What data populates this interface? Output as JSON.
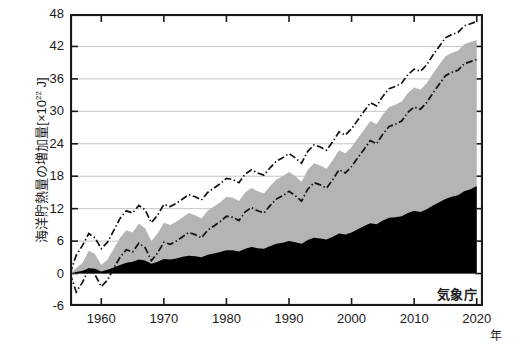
{
  "chart_data": {
    "type": "area",
    "title": "",
    "xlabel": "年",
    "ylabel_main": "海洋貯熱量の増加量[×10",
    "ylabel_sup": "22",
    "ylabel_tail": " J]",
    "credit": "気象庁",
    "xlim": [
      1955,
      2021
    ],
    "ylim": [
      -6,
      48
    ],
    "xticks": [
      1960,
      1970,
      1980,
      1990,
      2000,
      2010,
      2020
    ],
    "yticks": [
      -6,
      0,
      6,
      12,
      18,
      24,
      30,
      36,
      42,
      48
    ],
    "grid": "horizontal",
    "legend_position": "none",
    "colors": {
      "shallow_fill": "#000000",
      "deep_fill": "#b4b4b4",
      "bound_line": "#111111",
      "axis": "#1a1a1a",
      "grid": "#bdbdbd",
      "background": "#ffffff"
    },
    "x": [
      1955,
      1956,
      1957,
      1958,
      1959,
      1960,
      1961,
      1962,
      1963,
      1964,
      1965,
      1966,
      1967,
      1968,
      1969,
      1970,
      1971,
      1972,
      1973,
      1974,
      1975,
      1976,
      1977,
      1978,
      1979,
      1980,
      1981,
      1982,
      1983,
      1984,
      1985,
      1986,
      1987,
      1988,
      1989,
      1990,
      1991,
      1992,
      1993,
      1994,
      1995,
      1996,
      1997,
      1998,
      1999,
      2000,
      2001,
      2002,
      2003,
      2004,
      2005,
      2006,
      2007,
      2008,
      2009,
      2010,
      2011,
      2012,
      2013,
      2014,
      2015,
      2016,
      2017,
      2018,
      2019,
      2020
    ],
    "series": [
      {
        "name": "shallow-layer-heat-content",
        "role": "black-filled-area",
        "values": [
          0.0,
          0.3,
          0.5,
          1.0,
          0.9,
          0.4,
          0.7,
          1.1,
          1.6,
          2.0,
          2.2,
          2.6,
          2.4,
          1.8,
          2.2,
          2.7,
          2.6,
          2.8,
          3.1,
          3.3,
          3.2,
          3.0,
          3.5,
          3.7,
          4.0,
          4.3,
          4.3,
          4.1,
          4.6,
          4.9,
          4.7,
          4.6,
          5.1,
          5.5,
          5.7,
          6.0,
          5.8,
          5.5,
          6.2,
          6.6,
          6.5,
          6.3,
          6.8,
          7.4,
          7.2,
          7.6,
          8.2,
          8.8,
          9.3,
          9.1,
          9.8,
          10.3,
          10.4,
          10.6,
          11.2,
          11.6,
          11.4,
          11.9,
          12.6,
          13.2,
          13.8,
          14.2,
          14.5,
          15.2,
          15.6,
          16.2
        ]
      },
      {
        "name": "total-ocean-heat-content",
        "role": "gray-area-top",
        "values": [
          0.0,
          1.0,
          2.0,
          4.2,
          3.6,
          1.6,
          2.6,
          4.6,
          6.6,
          8.0,
          7.6,
          9.2,
          8.4,
          6.0,
          7.4,
          9.4,
          9.0,
          9.6,
          10.4,
          11.2,
          10.8,
          10.2,
          11.6,
          12.4,
          13.2,
          14.2,
          14.0,
          13.4,
          15.0,
          15.8,
          15.2,
          14.8,
          16.2,
          17.4,
          18.0,
          18.8,
          18.0,
          17.0,
          19.2,
          20.4,
          20.0,
          19.4,
          21.0,
          22.8,
          22.2,
          23.4,
          25.0,
          26.6,
          28.2,
          27.6,
          29.4,
          30.8,
          31.2,
          31.8,
          33.4,
          34.4,
          34.0,
          35.2,
          37.0,
          38.6,
          40.2,
          40.8,
          41.2,
          42.4,
          42.8,
          43.2
        ]
      },
      {
        "name": "upper-uncertainty-bound",
        "role": "dash-dot-line",
        "values": [
          0.0,
          3.4,
          5.2,
          7.4,
          6.6,
          4.6,
          5.8,
          8.0,
          10.2,
          11.6,
          11.2,
          12.6,
          11.8,
          9.4,
          10.8,
          12.8,
          12.4,
          13.0,
          13.8,
          14.6,
          14.2,
          13.6,
          15.0,
          15.8,
          16.6,
          17.6,
          17.4,
          16.8,
          18.4,
          19.2,
          18.6,
          18.2,
          19.6,
          20.8,
          21.4,
          22.2,
          21.4,
          20.4,
          22.6,
          23.8,
          23.4,
          22.8,
          24.4,
          26.2,
          25.6,
          26.8,
          28.4,
          30.0,
          31.6,
          31.0,
          32.8,
          34.2,
          34.6,
          35.2,
          36.8,
          37.8,
          37.4,
          38.6,
          40.4,
          42.0,
          43.6,
          44.2,
          44.6,
          45.8,
          46.2,
          46.6
        ]
      },
      {
        "name": "lower-uncertainty-bound",
        "role": "dash-dot-line",
        "values": [
          0.0,
          -3.4,
          -1.6,
          0.8,
          -0.2,
          -2.4,
          -1.2,
          1.0,
          3.0,
          4.4,
          4.0,
          5.6,
          4.8,
          2.4,
          3.8,
          5.8,
          5.4,
          6.0,
          6.8,
          7.6,
          7.2,
          6.6,
          8.0,
          8.8,
          9.6,
          10.6,
          10.4,
          9.8,
          11.4,
          12.2,
          11.6,
          11.2,
          12.6,
          13.8,
          14.4,
          15.2,
          14.4,
          13.4,
          15.6,
          16.8,
          16.4,
          15.8,
          17.4,
          19.2,
          18.6,
          19.8,
          21.4,
          23.0,
          24.6,
          24.0,
          25.8,
          27.2,
          27.6,
          28.2,
          29.8,
          30.8,
          30.4,
          31.6,
          33.4,
          35.0,
          36.6,
          37.2,
          37.6,
          38.8,
          39.2,
          39.6
        ]
      }
    ]
  }
}
